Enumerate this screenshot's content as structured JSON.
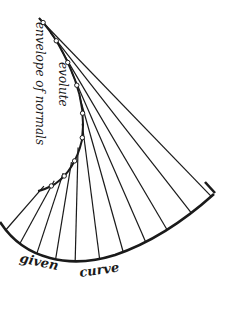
{
  "figure": {
    "labels": {
      "evolute": "evolute",
      "envelope": "envelope of normals",
      "given_curve_word1": "given",
      "given_curve_word2": "curve"
    },
    "colors": {
      "ink": "#1a1a1a",
      "background": "#ffffff"
    },
    "normal_count": 11,
    "marked_points_on_evolute": 9
  }
}
